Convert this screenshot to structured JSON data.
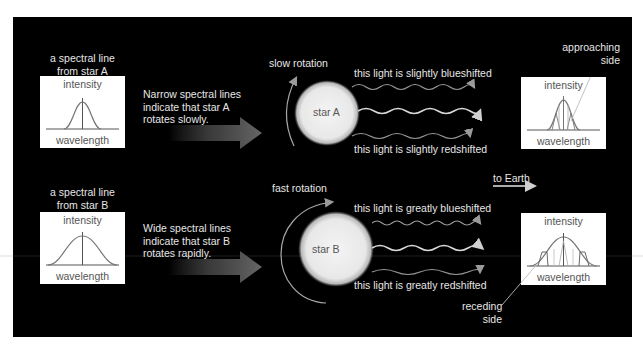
{
  "colors": {
    "background": "#000000",
    "frame": "#ffffff",
    "text": "#e6e6e6",
    "box_bg": "#ffffff",
    "box_text": "#555555",
    "star_fill": "#f2f2f2",
    "arrow_gray": "#5a5a5a"
  },
  "star_a": {
    "caption_line1": "a spectral line",
    "caption_line2": "from star A",
    "description_line1": "Narrow spectral lines",
    "description_line2": "indicate that star A",
    "description_line3": "rotates slowly.",
    "rotation_label": "slow rotation",
    "star_label": "star A",
    "top_light_label": "this light is slightly blueshifted",
    "bottom_light_label": "this light is slightly redshifted",
    "left_box": {
      "y_label": "intensity",
      "x_label": "wavelength",
      "line_width": "narrow"
    },
    "right_box": {
      "y_label": "intensity",
      "x_label": "wavelength"
    },
    "callout": {
      "line1": "approaching",
      "line2": "side"
    }
  },
  "star_b": {
    "caption_line1": "a spectral line",
    "caption_line2": "from star B",
    "description_line1": "Wide spectral lines",
    "description_line2": "indicate that star B",
    "description_line3": "rotates rapidly.",
    "rotation_label": "fast rotation",
    "star_label": "star B",
    "top_light_label": "this light is greatly blueshifted",
    "bottom_light_label": "this light is greatly redshifted",
    "left_box": {
      "y_label": "intensity",
      "x_label": "wavelength",
      "line_width": "wide"
    },
    "right_box": {
      "y_label": "intensity",
      "x_label": "wavelength"
    },
    "callout": {
      "line1": "receding",
      "line2": "side"
    }
  },
  "direction": {
    "label": "to Earth"
  }
}
